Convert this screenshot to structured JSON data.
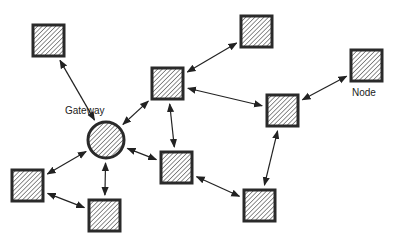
{
  "diagram": {
    "type": "network-topology",
    "labels": {
      "gateway": "Gateway",
      "node": "Node"
    },
    "colors": {
      "stroke": "#2a2a2a",
      "hatch": "#555555",
      "fill": "#ffffff"
    },
    "gateway": {
      "id": "gw",
      "cx": 106,
      "cy": 140,
      "r": 18
    },
    "nodes": [
      {
        "id": "n1",
        "x": 33,
        "y": 25
      },
      {
        "id": "n2",
        "x": 152,
        "y": 68
      },
      {
        "id": "n3",
        "x": 241,
        "y": 16
      },
      {
        "id": "n4",
        "x": 351,
        "y": 50
      },
      {
        "id": "n5",
        "x": 267,
        "y": 95
      },
      {
        "id": "n6",
        "x": 161,
        "y": 152
      },
      {
        "id": "n7",
        "x": 12,
        "y": 170
      },
      {
        "id": "n8",
        "x": 89,
        "y": 200
      },
      {
        "id": "n9",
        "x": 244,
        "y": 190
      }
    ],
    "edges": [
      {
        "from": "n1",
        "to": "gw"
      },
      {
        "from": "gw",
        "to": "n2"
      },
      {
        "from": "n2",
        "to": "n3"
      },
      {
        "from": "n2",
        "to": "n5"
      },
      {
        "from": "n2",
        "to": "n6"
      },
      {
        "from": "n5",
        "to": "n4"
      },
      {
        "from": "n5",
        "to": "n9"
      },
      {
        "from": "gw",
        "to": "n6"
      },
      {
        "from": "gw",
        "to": "n7"
      },
      {
        "from": "gw",
        "to": "n8"
      },
      {
        "from": "n7",
        "to": "n8"
      },
      {
        "from": "n6",
        "to": "n9"
      }
    ]
  }
}
